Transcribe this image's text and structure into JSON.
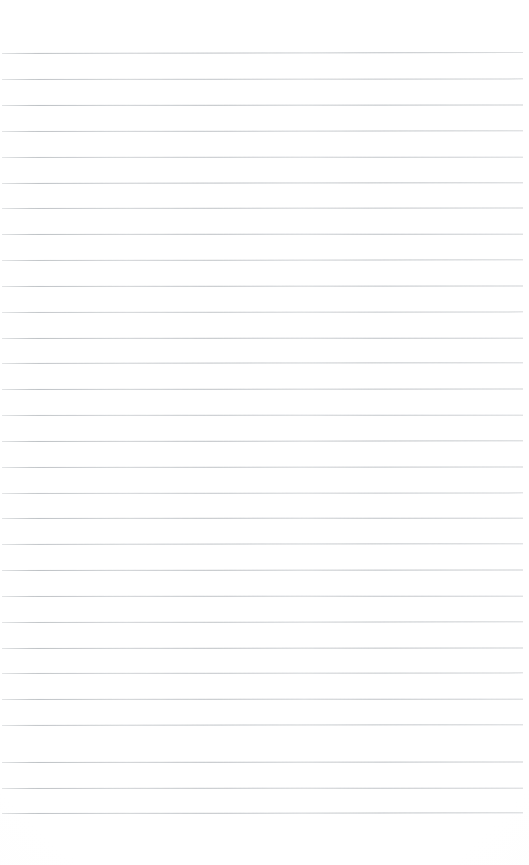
{
  "document": {
    "kind": "scanned-lined-paper",
    "title": "Blank ruled notebook page",
    "page_width": 529,
    "page_height": 865,
    "background_color": "#ffffff",
    "has_text_content": false,
    "has_handwriting": false,
    "visible_text": ""
  },
  "ruling": {
    "line_color": "#b9bdc1",
    "line_thickness": 1,
    "line_count": 30,
    "line_spacing": 25.85,
    "first_line_y": 53,
    "last_line_y": 813,
    "line_left_x": 2,
    "line_right_x": 523,
    "line_length": 521,
    "top_margin": 53,
    "bottom_margin": 52,
    "left_margin": 2,
    "right_margin": 6,
    "skew_degrees": -0.06
  },
  "lines": [
    {
      "index": 1,
      "y": 53,
      "skew": -0.1,
      "opacity": 0.92
    },
    {
      "index": 2,
      "y": 79,
      "skew": -0.07,
      "opacity": 0.88
    },
    {
      "index": 3,
      "y": 105,
      "skew": -0.05,
      "opacity": 0.95
    },
    {
      "index": 4,
      "y": 131,
      "skew": -0.08,
      "opacity": 0.9
    },
    {
      "index": 5,
      "y": 157,
      "skew": -0.04,
      "opacity": 0.86
    },
    {
      "index": 6,
      "y": 183,
      "skew": -0.09,
      "opacity": 0.93
    },
    {
      "index": 7,
      "y": 208,
      "skew": -0.06,
      "opacity": 0.89
    },
    {
      "index": 8,
      "y": 234,
      "skew": -0.03,
      "opacity": 0.94
    },
    {
      "index": 9,
      "y": 260,
      "skew": -0.08,
      "opacity": 0.87
    },
    {
      "index": 10,
      "y": 286,
      "skew": -0.05,
      "opacity": 0.91
    },
    {
      "index": 11,
      "y": 312,
      "skew": -0.07,
      "opacity": 0.85
    },
    {
      "index": 12,
      "y": 338,
      "skew": -0.04,
      "opacity": 0.93
    },
    {
      "index": 13,
      "y": 363,
      "skew": -0.09,
      "opacity": 0.88
    },
    {
      "index": 14,
      "y": 389,
      "skew": -0.06,
      "opacity": 0.92
    },
    {
      "index": 15,
      "y": 415,
      "skew": -0.03,
      "opacity": 0.86
    },
    {
      "index": 16,
      "y": 441,
      "skew": -0.08,
      "opacity": 0.94
    },
    {
      "index": 17,
      "y": 467,
      "skew": -0.05,
      "opacity": 0.89
    },
    {
      "index": 18,
      "y": 493,
      "skew": -0.07,
      "opacity": 0.84
    },
    {
      "index": 19,
      "y": 518,
      "skew": -0.04,
      "opacity": 0.92
    },
    {
      "index": 20,
      "y": 544,
      "skew": -0.09,
      "opacity": 0.88
    },
    {
      "index": 21,
      "y": 570,
      "skew": -0.06,
      "opacity": 0.95
    },
    {
      "index": 22,
      "y": 596,
      "skew": -0.03,
      "opacity": 0.9
    },
    {
      "index": 23,
      "y": 622,
      "skew": -0.08,
      "opacity": 0.87
    },
    {
      "index": 24,
      "y": 648,
      "skew": -0.05,
      "opacity": 0.93
    },
    {
      "index": 25,
      "y": 673,
      "skew": -0.07,
      "opacity": 0.86
    },
    {
      "index": 26,
      "y": 699,
      "skew": -0.04,
      "opacity": 0.91
    },
    {
      "index": 27,
      "y": 725,
      "skew": -0.09,
      "opacity": 0.89
    },
    {
      "index": 28,
      "y": 762,
      "skew": -0.06,
      "opacity": 0.94
    },
    {
      "index": 29,
      "y": 788,
      "skew": -0.03,
      "opacity": 0.9
    },
    {
      "index": 30,
      "y": 813,
      "skew": -0.08,
      "opacity": 0.92
    }
  ]
}
